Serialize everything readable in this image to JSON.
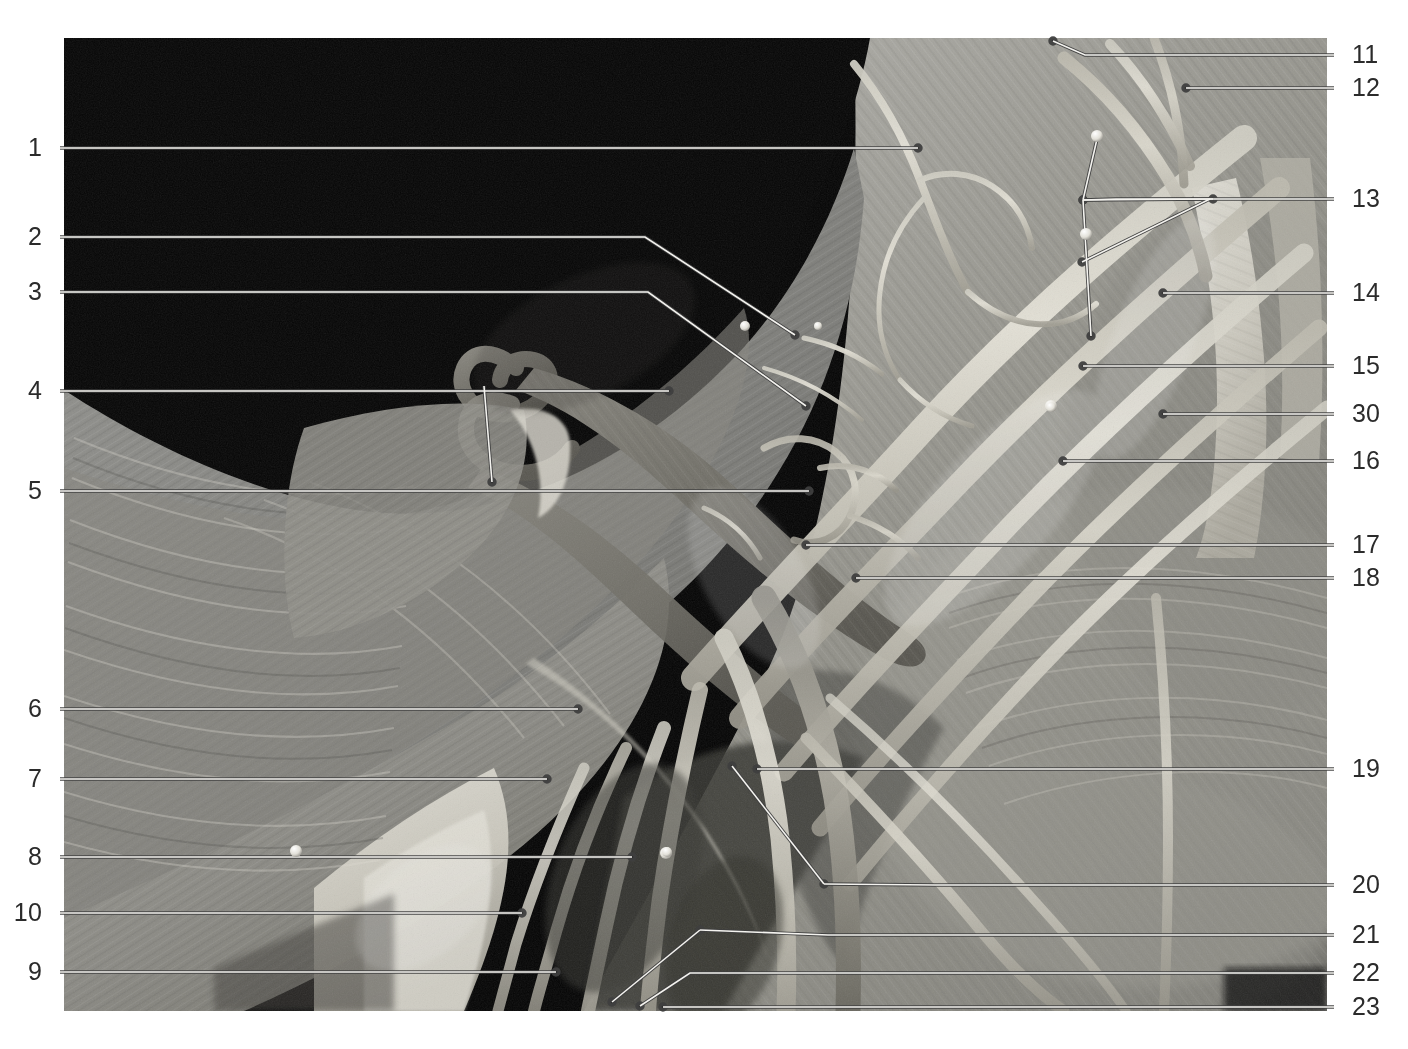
{
  "figure": {
    "kind": "anatomical-dissection-photograph",
    "region_label": "axilla-brachial-plexus",
    "photo_frame": {
      "x": 64,
      "y": 38,
      "width": 1263,
      "height": 973
    },
    "background_color": "#ffffff",
    "leader_line_color": "#f2f2f2",
    "leader_line_outline_color": "#4a4a4a",
    "number_color": "#2b2b2b"
  },
  "labels_left": [
    {
      "id": "label-1",
      "text": "1",
      "x": 42,
      "y": 148
    },
    {
      "id": "label-2",
      "text": "2",
      "x": 42,
      "y": 237
    },
    {
      "id": "label-3",
      "text": "3",
      "x": 42,
      "y": 292
    },
    {
      "id": "label-4",
      "text": "4",
      "x": 42,
      "y": 391
    },
    {
      "id": "label-5",
      "text": "5",
      "x": 42,
      "y": 491
    },
    {
      "id": "label-6",
      "text": "6",
      "x": 42,
      "y": 709
    },
    {
      "id": "label-7",
      "text": "7",
      "x": 42,
      "y": 779
    },
    {
      "id": "label-8",
      "text": "8",
      "x": 42,
      "y": 857
    },
    {
      "id": "label-10",
      "text": "10",
      "x": 42,
      "y": 913
    },
    {
      "id": "label-9",
      "text": "9",
      "x": 42,
      "y": 972
    }
  ],
  "labels_right": [
    {
      "id": "label-11",
      "text": "11",
      "x": 1352,
      "y": 55
    },
    {
      "id": "label-12",
      "text": "12",
      "x": 1352,
      "y": 88
    },
    {
      "id": "label-13",
      "text": "13",
      "x": 1352,
      "y": 199
    },
    {
      "id": "label-14",
      "text": "14",
      "x": 1352,
      "y": 293
    },
    {
      "id": "label-15",
      "text": "15",
      "x": 1352,
      "y": 366
    },
    {
      "id": "label-30",
      "text": "30",
      "x": 1352,
      "y": 414
    },
    {
      "id": "label-16",
      "text": "16",
      "x": 1352,
      "y": 461
    },
    {
      "id": "label-17",
      "text": "17",
      "x": 1352,
      "y": 545
    },
    {
      "id": "label-18",
      "text": "18",
      "x": 1352,
      "y": 578
    },
    {
      "id": "label-19",
      "text": "19",
      "x": 1352,
      "y": 769
    },
    {
      "id": "label-20",
      "text": "20",
      "x": 1352,
      "y": 885
    },
    {
      "id": "label-21",
      "text": "21",
      "x": 1352,
      "y": 935
    },
    {
      "id": "label-22",
      "text": "22",
      "x": 1352,
      "y": 973
    },
    {
      "id": "label-23",
      "text": "23",
      "x": 1352,
      "y": 1007
    }
  ],
  "leaders": [
    {
      "id": "leader-1",
      "for": "1",
      "points": "60,148 918,148"
    },
    {
      "id": "leader-2",
      "for": "2",
      "points": "60,237 645,237 795,335"
    },
    {
      "id": "leader-3",
      "for": "3",
      "points": "60,292 648,292 806,406"
    },
    {
      "id": "leader-4",
      "for": "4",
      "points": "60,391 669,391"
    },
    {
      "id": "leader-4b",
      "for": "4",
      "points": "484,386 492,482"
    },
    {
      "id": "leader-5",
      "for": "5",
      "points": "60,491 809,491"
    },
    {
      "id": "leader-6",
      "for": "6",
      "points": "60,709 578,709"
    },
    {
      "id": "leader-7",
      "for": "7",
      "points": "60,779 547,779"
    },
    {
      "id": "leader-8",
      "for": "8",
      "points": "60,857 632,857"
    },
    {
      "id": "leader-10",
      "for": "10",
      "points": "60,913 522,913"
    },
    {
      "id": "leader-9",
      "for": "9",
      "points": "60,972 556,972"
    },
    {
      "id": "leader-11",
      "for": "11",
      "points": "1334,55 1085,55 1053,41"
    },
    {
      "id": "leader-12",
      "for": "12",
      "points": "1334,88 1186,88"
    },
    {
      "id": "leader-13a",
      "for": "13",
      "points": "1334,199 1116,199 1083,200"
    },
    {
      "id": "leader-13b",
      "for": "13",
      "points": "1210,199 1082,262"
    },
    {
      "id": "leader-13c",
      "for": "13",
      "points": "1083,200 1213,199"
    },
    {
      "id": "leader-13d",
      "for": "13",
      "points": "1097,139 1083,200"
    },
    {
      "id": "leader-13e",
      "for": "13",
      "points": "1083,200 1091,336"
    },
    {
      "id": "leader-14",
      "for": "14",
      "points": "1334,293 1163,293"
    },
    {
      "id": "leader-15",
      "for": "15",
      "points": "1334,366 1083,366"
    },
    {
      "id": "leader-30",
      "for": "30",
      "points": "1334,414 1163,414"
    },
    {
      "id": "leader-16",
      "for": "16",
      "points": "1334,461 1063,461"
    },
    {
      "id": "leader-17",
      "for": "17",
      "points": "1334,545 806,545"
    },
    {
      "id": "leader-18",
      "for": "18",
      "points": "1334,578 856,578"
    },
    {
      "id": "leader-19",
      "for": "19",
      "points": "1334,769 757,769"
    },
    {
      "id": "leader-20",
      "for": "20",
      "points": "1334,885 935,885 824,884"
    },
    {
      "id": "leader-20b",
      "for": "20",
      "points": "824,884 732,766"
    },
    {
      "id": "leader-21",
      "for": "21",
      "points": "1334,935 828,935 700,930"
    },
    {
      "id": "leader-21b",
      "for": "21",
      "points": "700,930 612,1002"
    },
    {
      "id": "leader-22",
      "for": "22",
      "points": "1334,973 690,973 640,1006"
    },
    {
      "id": "leader-23",
      "for": "23",
      "points": "1334,1007 663,1007"
    }
  ],
  "pins": [
    {
      "id": "pin-a",
      "cx": 745,
      "cy": 326,
      "r": 5
    },
    {
      "id": "pin-b",
      "cx": 1097,
      "cy": 136,
      "r": 6
    },
    {
      "id": "pin-c",
      "cx": 1086,
      "cy": 234,
      "r": 6
    },
    {
      "id": "pin-d",
      "cx": 1051,
      "cy": 406,
      "r": 6
    },
    {
      "id": "pin-e",
      "cx": 1051,
      "cy": 407,
      "r": 5
    },
    {
      "id": "pin-f",
      "cx": 296,
      "cy": 851,
      "r": 6
    },
    {
      "id": "pin-g",
      "cx": 666,
      "cy": 853,
      "r": 6
    },
    {
      "id": "pin-h",
      "cx": 667,
      "cy": 852,
      "r": 5
    },
    {
      "id": "pin-i",
      "cx": 818,
      "cy": 326,
      "r": 4
    }
  ]
}
